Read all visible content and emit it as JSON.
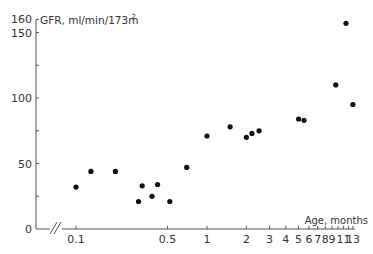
{
  "chart_data": {
    "type": "scatter",
    "title": "",
    "ylabel": "GFR, ml/min/1.73m²",
    "ylabel_main": "GFR, ml/min/173m",
    "ylabel_sup": "2",
    "xlabel": "Age, months",
    "xscale": "log",
    "xlim": [
      0.1,
      13
    ],
    "ylim": [
      0,
      160
    ],
    "grid": false,
    "legend": null,
    "axis_break": "//",
    "y_ticks": [
      {
        "value": 0,
        "label": "0"
      },
      {
        "value": 25,
        "label": ""
      },
      {
        "value": 50,
        "label": "50"
      },
      {
        "value": 75,
        "label": ""
      },
      {
        "value": 100,
        "label": "100"
      },
      {
        "value": 125,
        "label": ""
      },
      {
        "value": 150,
        "label": "150"
      },
      {
        "value": 160,
        "label": "160"
      }
    ],
    "x_ticks": [
      {
        "value": 0.1,
        "label": "0.1"
      },
      {
        "value": 0.5,
        "label": "0.5"
      },
      {
        "value": 1,
        "label": "1"
      },
      {
        "value": 2,
        "label": "2"
      },
      {
        "value": 3,
        "label": "3"
      },
      {
        "value": 4,
        "label": "4"
      },
      {
        "value": 5,
        "label": "5"
      },
      {
        "value": 6,
        "label": "6"
      },
      {
        "value": 7,
        "label": "7"
      },
      {
        "value": 8,
        "label": "8"
      },
      {
        "value": 9,
        "label": "9"
      },
      {
        "value": 10,
        "label": ""
      },
      {
        "value": 11,
        "label": "11"
      },
      {
        "value": 12,
        "label": ""
      },
      {
        "value": 13,
        "label": "13"
      }
    ],
    "series": [
      {
        "name": "GFR",
        "x": [
          0.1,
          0.13,
          0.2,
          0.3,
          0.32,
          0.38,
          0.42,
          0.52,
          0.7,
          1.0,
          1.5,
          2.0,
          2.2,
          2.5,
          5.0,
          5.5,
          9.6,
          11.5,
          13
        ],
        "y": [
          32,
          44,
          44,
          21,
          33,
          25,
          34,
          21,
          47,
          71,
          78,
          70,
          73,
          75,
          84,
          83,
          110,
          157,
          95
        ]
      }
    ]
  }
}
